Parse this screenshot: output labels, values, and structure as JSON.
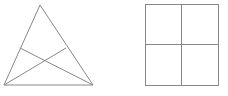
{
  "canvas": {
    "width": 228,
    "height": 96,
    "background_color": "#ffffff"
  },
  "style": {
    "stroke_color": "#888888",
    "stroke_color_dark": "#777777",
    "stroke_width": 1
  },
  "figures": [
    {
      "id": "triangle-with-cevians",
      "name": "triangle-figure",
      "shape": "triangle",
      "description": "Isosceles triangle with two intersecting cevians",
      "vertices": {
        "apex": [
          40,
          5
        ],
        "bottom_left": [
          4,
          85
        ],
        "bottom_right": [
          93,
          85
        ]
      },
      "side_points": {
        "left_side_point": [
          20,
          48
        ],
        "right_side_point": [
          66,
          48
        ]
      },
      "intersection_point": [
        46,
        63
      ],
      "segments": [
        {
          "name": "left-side",
          "from": [
            40,
            5
          ],
          "to": [
            4,
            85
          ]
        },
        {
          "name": "right-side",
          "from": [
            40,
            5
          ],
          "to": [
            93,
            85
          ]
        },
        {
          "name": "base",
          "from": [
            4,
            85
          ],
          "to": [
            93,
            85
          ]
        },
        {
          "name": "cevian-left-to-bottom-right",
          "from": [
            20,
            48
          ],
          "to": [
            93,
            85
          ]
        },
        {
          "name": "cevian-bottom-left-to-right",
          "from": [
            4,
            85
          ],
          "to": [
            66,
            48
          ]
        }
      ]
    },
    {
      "id": "square-quadrants",
      "name": "square-figure",
      "shape": "square",
      "description": "Square divided into four equal quadrants",
      "bounds": {
        "x": 145,
        "y": 4,
        "width": 73,
        "height": 81
      },
      "divider_x": 181,
      "divider_y": 44,
      "segments": [
        {
          "name": "top-edge",
          "from": [
            145,
            4
          ],
          "to": [
            218,
            4
          ]
        },
        {
          "name": "right-edge",
          "from": [
            218,
            4
          ],
          "to": [
            218,
            85
          ]
        },
        {
          "name": "bottom-edge",
          "from": [
            218,
            85
          ],
          "to": [
            145,
            85
          ]
        },
        {
          "name": "left-edge",
          "from": [
            145,
            85
          ],
          "to": [
            145,
            4
          ]
        },
        {
          "name": "vertical-divider",
          "from": [
            181,
            4
          ],
          "to": [
            181,
            85
          ]
        },
        {
          "name": "horizontal-divider",
          "from": [
            145,
            44
          ],
          "to": [
            218,
            44
          ]
        }
      ],
      "cells": 4
    }
  ]
}
